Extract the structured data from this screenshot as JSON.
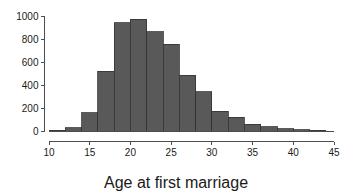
{
  "chart_data": {
    "type": "bar",
    "title": "",
    "subtitle": "",
    "xlabel": "Age at first marriage",
    "ylabel": "",
    "xlim": [
      10,
      45
    ],
    "ylim": [
      0,
      1000
    ],
    "grid": false,
    "legend": null,
    "bin_width": 2,
    "bin_edges": [
      10,
      12,
      14,
      16,
      18,
      20,
      22,
      24,
      26,
      28,
      30,
      32,
      34,
      36,
      38,
      40,
      42,
      44
    ],
    "categories": [
      "10-12",
      "12-14",
      "14-16",
      "16-18",
      "18-20",
      "20-22",
      "22-24",
      "24-26",
      "26-28",
      "28-30",
      "30-32",
      "32-34",
      "34-36",
      "36-38",
      "38-40",
      "40-42",
      "42-44"
    ],
    "values": [
      5,
      30,
      160,
      520,
      940,
      970,
      865,
      755,
      485,
      340,
      170,
      120,
      60,
      35,
      20,
      10,
      5
    ],
    "x_ticks": [
      10,
      15,
      20,
      25,
      30,
      35,
      40,
      45
    ],
    "x_tick_labels": [
      "10",
      "15",
      "20",
      "25",
      "30",
      "35",
      "40",
      "45"
    ],
    "y_ticks": [
      0,
      200,
      400,
      600,
      800,
      1000
    ],
    "y_tick_labels": [
      "0",
      "200",
      "400",
      "600",
      "800",
      "1000"
    ],
    "bar_fill_color": "#595959",
    "bar_border_color": "#333333",
    "axis_color": "#4d4d4d",
    "background_color": "#ffffff"
  },
  "axes": {
    "x_axis_name": "x-axis",
    "y_axis_name": "y-axis"
  }
}
